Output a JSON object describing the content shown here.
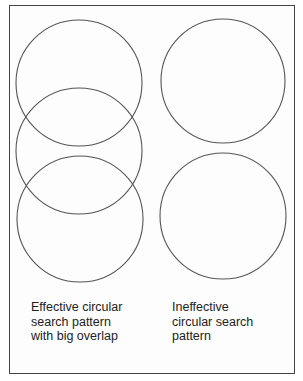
{
  "diagram": {
    "left_panel": {
      "caption": "Effective circular\nsearch pattern\nwith big overlap",
      "circles": [
        {
          "cx": 79,
          "cy": 83,
          "r": 63
        },
        {
          "cx": 79,
          "cy": 151,
          "r": 63
        },
        {
          "cx": 80,
          "cy": 219,
          "r": 63
        }
      ]
    },
    "right_panel": {
      "caption": "Ineffective\ncircular search\npattern",
      "circles": [
        {
          "cx": 223,
          "cy": 81,
          "r": 62
        },
        {
          "cx": 223,
          "cy": 216,
          "r": 63
        }
      ]
    },
    "stroke_color": "#555555"
  }
}
